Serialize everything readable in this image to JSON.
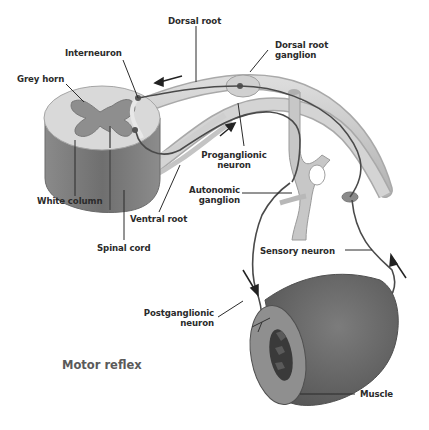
{
  "diagram": {
    "title": "Motor reflex",
    "labels": {
      "dorsal_root": "Dorsal root",
      "dorsal_root_ganglion_1": "Dorsal root",
      "dorsal_root_ganglion_2": "ganglion",
      "interneuron": "Interneuron",
      "grey_horn": "Grey horn",
      "proganglionic_1": "Proganglionic",
      "proganglionic_2": "neuron",
      "autonomic_1": "Autonomic",
      "autonomic_2": "ganglion",
      "white_column": "White column",
      "ventral_root": "Ventral root",
      "spinal_cord": "Spinal cord",
      "sensory_neuron": "Sensory neuron",
      "postganglionic_1": "Postganglionic",
      "postganglionic_2": "neuron",
      "muscle": "Muscle"
    },
    "colors": {
      "background": "#ffffff",
      "cord_white_matter": "#d6d6d6",
      "cord_side": "#7a7a7a",
      "grey_matter": "#8f8f8f",
      "nerve": "#c9c9c9",
      "neuron_line": "#4a4a4a",
      "muscle": "#6e6e6e",
      "label_text": "#2b2b2b",
      "title_text": "#5a5a5a"
    }
  }
}
